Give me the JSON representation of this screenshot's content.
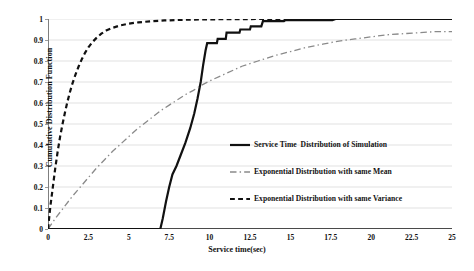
{
  "chart_data": {
    "type": "line",
    "title": "",
    "xlabel": "Service time(sec)",
    "ylabel": "Cumulative Distribution Function",
    "xlim": [
      0,
      25
    ],
    "ylim": [
      0,
      1
    ],
    "grid": true,
    "legend_position": "center-right",
    "xticks": [
      "0",
      "2.5",
      "5",
      "7.5",
      "10",
      "12.5",
      "15",
      "17.5",
      "20",
      "22.5",
      "25"
    ],
    "xtick_values": [
      0,
      2.5,
      5,
      7.5,
      10,
      12.5,
      15,
      17.5,
      20,
      22.5,
      25
    ],
    "yticks": [
      "0",
      "0.1",
      "0.2",
      "0.3",
      "0.4",
      "0.5",
      "0.6",
      "0.7",
      "0.8",
      "0.9",
      "1"
    ],
    "ytick_values": [
      0,
      0.1,
      0.2,
      0.3,
      0.4,
      0.5,
      0.6,
      0.7,
      0.8,
      0.9,
      1
    ],
    "series": [
      {
        "name": "Service Time  Distribution of Simulation",
        "style": "solid",
        "color": "#111111",
        "width": 2.2,
        "points": [
          [
            0.0,
            0.0
          ],
          [
            6.95,
            0.0
          ],
          [
            7.1,
            0.05
          ],
          [
            7.3,
            0.13
          ],
          [
            7.5,
            0.2
          ],
          [
            7.7,
            0.26
          ],
          [
            7.95,
            0.3
          ],
          [
            8.2,
            0.35
          ],
          [
            8.5,
            0.41
          ],
          [
            8.8,
            0.48
          ],
          [
            9.05,
            0.55
          ],
          [
            9.25,
            0.62
          ],
          [
            9.45,
            0.7
          ],
          [
            9.6,
            0.78
          ],
          [
            9.75,
            0.85
          ],
          [
            9.85,
            0.885
          ],
          [
            10.45,
            0.885
          ],
          [
            10.5,
            0.905
          ],
          [
            11.0,
            0.905
          ],
          [
            11.05,
            0.935
          ],
          [
            11.85,
            0.935
          ],
          [
            11.9,
            0.95
          ],
          [
            12.5,
            0.95
          ],
          [
            12.55,
            0.965
          ],
          [
            13.2,
            0.965
          ],
          [
            13.3,
            0.99
          ],
          [
            14.6,
            0.99
          ],
          [
            14.7,
            0.995
          ],
          [
            17.6,
            0.995
          ],
          [
            17.8,
            1.0
          ],
          [
            25.0,
            1.0
          ]
        ]
      },
      {
        "name": "Exponential Distribution with same Mean",
        "style": "dashdot",
        "color": "#8a8a8a",
        "width": 1.3,
        "points": [
          [
            0.0,
            0.0
          ],
          [
            0.5,
            0.055
          ],
          [
            1.0,
            0.105
          ],
          [
            1.5,
            0.155
          ],
          [
            2.0,
            0.2
          ],
          [
            2.5,
            0.245
          ],
          [
            3.0,
            0.29
          ],
          [
            3.5,
            0.33
          ],
          [
            4.0,
            0.37
          ],
          [
            4.5,
            0.405
          ],
          [
            5.0,
            0.44
          ],
          [
            5.5,
            0.475
          ],
          [
            6.0,
            0.505
          ],
          [
            6.5,
            0.535
          ],
          [
            7.0,
            0.565
          ],
          [
            7.5,
            0.59
          ],
          [
            8.0,
            0.615
          ],
          [
            8.5,
            0.64
          ],
          [
            9.0,
            0.66
          ],
          [
            9.5,
            0.685
          ],
          [
            10.0,
            0.705
          ],
          [
            11.0,
            0.74
          ],
          [
            12.0,
            0.775
          ],
          [
            13.0,
            0.8
          ],
          [
            14.0,
            0.825
          ],
          [
            15.0,
            0.845
          ],
          [
            16.0,
            0.865
          ],
          [
            17.0,
            0.88
          ],
          [
            18.0,
            0.895
          ],
          [
            19.0,
            0.905
          ],
          [
            20.0,
            0.915
          ],
          [
            21.0,
            0.925
          ],
          [
            22.0,
            0.93
          ],
          [
            23.0,
            0.935
          ],
          [
            24.0,
            0.94
          ],
          [
            25.0,
            0.94
          ]
        ]
      },
      {
        "name": "Exponential Distribution with same Variance",
        "style": "dashed",
        "color": "#111111",
        "width": 2.2,
        "points": [
          [
            0.0,
            0.0
          ],
          [
            0.15,
            0.11
          ],
          [
            0.3,
            0.2
          ],
          [
            0.45,
            0.29
          ],
          [
            0.6,
            0.37
          ],
          [
            0.75,
            0.44
          ],
          [
            0.9,
            0.5
          ],
          [
            1.05,
            0.555
          ],
          [
            1.2,
            0.605
          ],
          [
            1.35,
            0.65
          ],
          [
            1.5,
            0.69
          ],
          [
            1.7,
            0.735
          ],
          [
            1.9,
            0.775
          ],
          [
            2.1,
            0.81
          ],
          [
            2.3,
            0.84
          ],
          [
            2.5,
            0.865
          ],
          [
            2.75,
            0.89
          ],
          [
            3.0,
            0.91
          ],
          [
            3.3,
            0.93
          ],
          [
            3.6,
            0.945
          ],
          [
            4.0,
            0.958
          ],
          [
            4.5,
            0.97
          ],
          [
            5.0,
            0.978
          ],
          [
            5.6,
            0.984
          ],
          [
            6.3,
            0.989
          ],
          [
            7.2,
            0.993
          ],
          [
            8.3,
            0.996
          ],
          [
            9.5,
            0.998
          ],
          [
            11.0,
            0.999
          ],
          [
            13.0,
            1.0
          ],
          [
            25.0,
            1.0
          ]
        ]
      }
    ]
  },
  "legend": {
    "items": [
      {
        "label": "Service Time  Distribution of Simulation",
        "style": "solid"
      },
      {
        "label": "Exponential Distribution with same Mean",
        "style": "dashdot"
      },
      {
        "label": "Exponential Distribution with same Variance",
        "style": "dashed"
      }
    ]
  },
  "axes": {
    "x_title": "Service time(sec)",
    "y_title": "Cumulative Distribution Function"
  },
  "colors": {
    "primary": "#111111",
    "secondary": "#8a8a8a",
    "grid": "#d9d9d9",
    "axis": "#7f7f7f",
    "background": "#ffffff"
  }
}
